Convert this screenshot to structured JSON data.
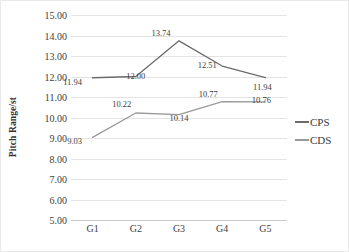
{
  "chart_data": {
    "type": "line",
    "title": "",
    "xlabel": "",
    "ylabel": "Pitch Range/st",
    "categories": [
      "G1",
      "G2",
      "G3",
      "G4",
      "G5"
    ],
    "ylim": [
      5.0,
      15.0
    ],
    "ytick_step": 1.0,
    "ytick_labels": [
      "15.00",
      "14.00",
      "13.00",
      "12.00",
      "11.00",
      "10.00",
      "9.00",
      "8.00",
      "7.00",
      "6.00",
      "5.00"
    ],
    "ytick_values": [
      15.0,
      14.0,
      13.0,
      12.0,
      11.0,
      10.0,
      9.0,
      8.0,
      7.0,
      6.0,
      5.0
    ],
    "grid": true,
    "legend_position": "right",
    "series": [
      {
        "name": "CPS",
        "color": "#6b6b6b",
        "values": [
          11.94,
          12.0,
          13.74,
          12.51,
          11.94
        ],
        "labels": [
          "11.94",
          "12.00",
          "13.74",
          "12.51",
          "11.94"
        ]
      },
      {
        "name": "CDS",
        "color": "#9a9a9a",
        "values": [
          9.03,
          10.22,
          10.14,
          10.77,
          10.76
        ],
        "labels": [
          "9.03",
          "10.22",
          "10.14",
          "10.77",
          "10.76"
        ]
      }
    ]
  },
  "colors": {
    "gridline": "#e4e4e4",
    "axis": "#c9c9c9",
    "border": "#e9e9e9",
    "text": "#3a3a3a",
    "background": "#ffffff"
  }
}
